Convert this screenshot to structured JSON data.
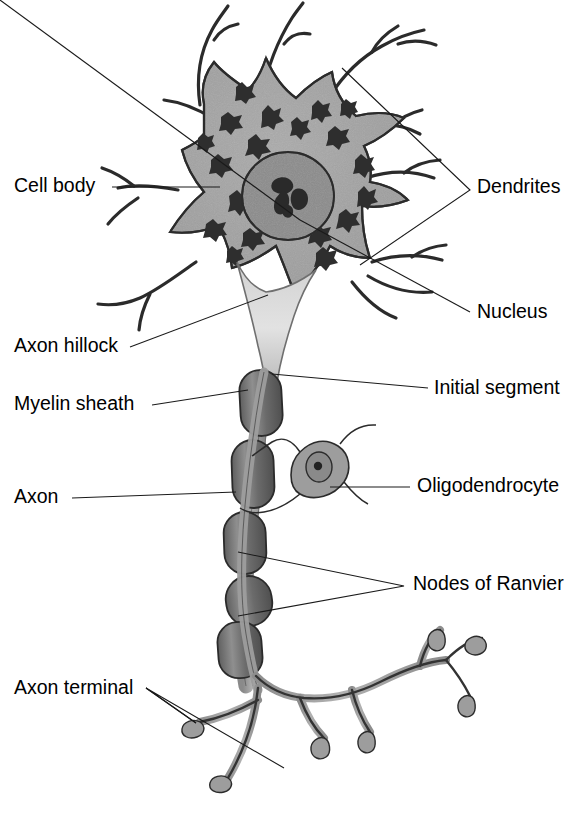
{
  "figure": {
    "background_color": "#ffffff"
  },
  "palette": {
    "soma_fill": "#a3a3a3",
    "nucleus_fill": "#8a8a8a",
    "nissl_fill": "#2e2e2e",
    "nucleolus_fill": "#2e2e2e",
    "hillock_fill": "#d9d9d9",
    "axon_fill": "#9a9a9a",
    "myelin_fill": "#6e6e6e",
    "myelin_highlight": "#8d8d8d",
    "terminal_fill": "#9a9a9a",
    "oligodendrocyte_fill": "#9a9a9a",
    "outline_stroke": "#2b2b2b",
    "leader_stroke": "#1a1a1a",
    "label_color": "#000000"
  },
  "labels": {
    "cell_body": {
      "text": "Cell body",
      "x": 14,
      "y": 192,
      "anchor": "start"
    },
    "axon_hillock": {
      "text": "Axon hillock",
      "x": 14,
      "y": 352,
      "anchor": "start"
    },
    "myelin_sheath": {
      "text": "Myelin sheath",
      "x": 14,
      "y": 410,
      "anchor": "start"
    },
    "axon": {
      "text": "Axon",
      "x": 14,
      "y": 503,
      "anchor": "start"
    },
    "axon_terminal": {
      "text": "Axon terminal",
      "x": 14,
      "y": 694,
      "anchor": "start"
    },
    "dendrites": {
      "text": "Dendrites",
      "x": 477,
      "y": 193,
      "anchor": "start"
    },
    "nucleus": {
      "text": "Nucleus",
      "x": 477,
      "y": 318,
      "anchor": "start"
    },
    "initial_segment": {
      "text": "Initial segment",
      "x": 434,
      "y": 394,
      "anchor": "start"
    },
    "oligodendrocyte": {
      "text": "Oligodendrocyte",
      "x": 417,
      "y": 492,
      "anchor": "start"
    },
    "nodes_of_ranvier": {
      "text": "Nodes of Ranvier",
      "x": 413,
      "y": 590,
      "anchor": "start"
    }
  },
  "structures": {
    "soma": "cell-body",
    "nucleus": "nucleus",
    "nucleolus": "nucleolus",
    "nissl_bodies_count": 22,
    "dendrite_branches": 7,
    "myelin_segments": 5,
    "nodes_of_ranvier_count": 4,
    "axon_terminal_boutons": 6,
    "oligodendrocyte": "oligodendrocyte"
  }
}
